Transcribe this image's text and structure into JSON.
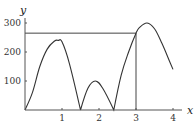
{
  "chart_data": {
    "type": "line",
    "title": "",
    "xlabel": "x",
    "ylabel": "y",
    "xlim": [
      0,
      4.1
    ],
    "ylim": [
      0,
      320
    ],
    "x_ticks": [
      "1",
      "2",
      "3",
      "4"
    ],
    "y_ticks": [
      "100",
      "200",
      "300"
    ],
    "grid": false,
    "legend": null,
    "series": [
      {
        "name": "curve",
        "x": [
          0,
          0.2,
          0.4,
          0.6,
          0.8,
          0.9,
          1.0,
          1.2,
          1.5,
          1.7,
          1.9,
          2.1,
          2.4,
          2.6,
          2.8,
          3.0,
          3.1,
          3.3,
          3.5,
          3.7,
          3.9,
          4.0
        ],
        "y": [
          0,
          60,
          150,
          210,
          238,
          240,
          235,
          160,
          0,
          75,
          100,
          75,
          0,
          120,
          200,
          265,
          285,
          300,
          280,
          230,
          170,
          140
        ]
      }
    ],
    "annotations": [
      {
        "type": "hline",
        "y": 265,
        "x_from": 0,
        "x_to": 3
      },
      {
        "type": "vline",
        "x": 3,
        "y_from": 0,
        "y_to": 265
      }
    ]
  }
}
